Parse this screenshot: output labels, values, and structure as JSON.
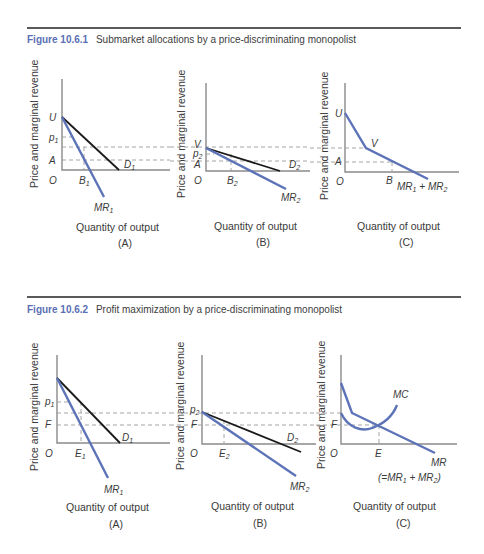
{
  "figures": [
    {
      "number": "Figure 10.6.1",
      "title": "Submarket allocations by a price-discriminating monopolist",
      "panels": [
        {
          "id": "A",
          "caption": "(A)",
          "xlabel": "Quantity of output",
          "ylabel": "Price and marginal revenue",
          "labels": {
            "U": "U",
            "p": "p",
            "p_sub": "1",
            "A": "A",
            "O": "O",
            "B": "B",
            "B_sub": "1",
            "D": "D",
            "D_sub": "1",
            "MR": "MR",
            "MR_sub": "1"
          }
        },
        {
          "id": "B",
          "caption": "(B)",
          "xlabel": "Quantity of output",
          "ylabel": "Price and marginal revenue",
          "labels": {
            "V": "V",
            "p": "p",
            "p_sub": "2",
            "A": "A",
            "O": "O",
            "B": "B",
            "B_sub": "2",
            "D": "D",
            "D_sub": "2",
            "MR": "MR",
            "MR_sub": "2"
          }
        },
        {
          "id": "C",
          "caption": "(C)",
          "xlabel": "Quantity of output",
          "ylabel": "Price and marginal revenue",
          "labels": {
            "U": "U",
            "V": "V",
            "A": "A",
            "O": "O",
            "B": "B",
            "MR_sum_a": "MR",
            "sub1": "1",
            "plus": " + ",
            "MR_sum_b": "MR",
            "sub2": "2"
          }
        }
      ]
    },
    {
      "number": "Figure 10.6.2",
      "title": "Profit maximization by a price-discriminating monopolist",
      "panels": [
        {
          "id": "A",
          "caption": "(A)",
          "xlabel": "Quantity of output",
          "ylabel": "Price and marginal revenue",
          "labels": {
            "p": "p",
            "p_sub": "1",
            "F": "F",
            "O": "O",
            "E": "E",
            "E_sub": "1",
            "D": "D",
            "D_sub": "1",
            "MR": "MR",
            "MR_sub": "1"
          }
        },
        {
          "id": "B",
          "caption": "(B)",
          "xlabel": "Quantity of output",
          "ylabel": "Price and marginal revenue",
          "labels": {
            "p": "p",
            "p_sub": "2",
            "F": "F",
            "O": "O",
            "E": "E",
            "E_sub": "2",
            "D": "D",
            "D_sub": "2",
            "MR": "MR",
            "MR_sub": "2"
          }
        },
        {
          "id": "C",
          "caption": "(C)",
          "xlabel": "Quantity of output",
          "ylabel": "Price and marginal revenue",
          "labels": {
            "MC": "MC",
            "F": "F",
            "O": "O",
            "E": "E",
            "MR": "MR",
            "eq_open": "(=MR",
            "sub1": "1",
            "plus": " + MR",
            "sub2": "2",
            "eq_close": ")"
          }
        }
      ]
    }
  ],
  "colors": {
    "figure_number": "#5a6fb5",
    "mr_curve": "#5d73b8",
    "demand_curve": "#1a1a1a",
    "axis": "#8a8a8a"
  }
}
